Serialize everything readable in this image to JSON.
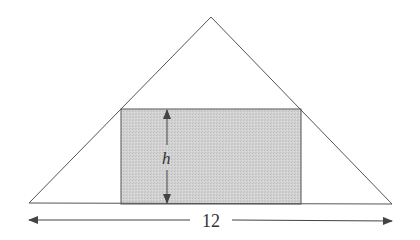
{
  "diagram": {
    "type": "triangle-inscribed-rectangle",
    "triangle": {
      "apex": [
        211,
        17
      ],
      "base_left": [
        29,
        203
      ],
      "base_right": [
        392,
        204
      ],
      "stroke": "#555555"
    },
    "rectangle": {
      "x": 121,
      "y": 109,
      "width": 180,
      "height": 95,
      "fill": "#cfcfcf",
      "stroke": "#555555"
    },
    "height_arrow": {
      "x": 167,
      "y1": 110,
      "y2": 203,
      "label": "h",
      "label_pos": [
        162,
        163
      ]
    },
    "width_arrow": {
      "y": 220,
      "x1": 29,
      "x2": 392,
      "gap": [
        190,
        232
      ],
      "label": "12",
      "label_pos": [
        211,
        227
      ]
    }
  }
}
